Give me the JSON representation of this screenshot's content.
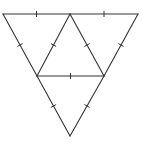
{
  "diagram": {
    "type": "subdivided-triangle",
    "colors": {
      "stroke": "#333333",
      "background": "#ffffff"
    },
    "vertices": {
      "A": [
        3,
        14
      ],
      "B": [
        138,
        14
      ],
      "C": [
        70,
        136
      ],
      "M_AB": [
        70,
        14
      ],
      "M_AC": [
        37,
        76
      ],
      "M_BC": [
        104,
        76
      ]
    },
    "segments": [
      {
        "id": "A-M_AB",
        "from": "A",
        "to": "M_AB",
        "ticks": 1
      },
      {
        "id": "M_AB-B",
        "from": "M_AB",
        "to": "B",
        "ticks": 1
      },
      {
        "id": "A-M_AC",
        "from": "A",
        "to": "M_AC",
        "ticks": 1
      },
      {
        "id": "M_AC-C",
        "from": "M_AC",
        "to": "C",
        "ticks": 1
      },
      {
        "id": "B-M_BC",
        "from": "B",
        "to": "M_BC",
        "ticks": 1
      },
      {
        "id": "M_BC-C",
        "from": "M_BC",
        "to": "C",
        "ticks": 1
      },
      {
        "id": "M_AB-M_AC",
        "from": "M_AB",
        "to": "M_AC",
        "ticks": 1
      },
      {
        "id": "M_AB-M_BC",
        "from": "M_AB",
        "to": "M_BC",
        "ticks": 1
      },
      {
        "id": "M_AC-M_BC",
        "from": "M_AC",
        "to": "M_BC",
        "ticks": 1
      }
    ]
  }
}
